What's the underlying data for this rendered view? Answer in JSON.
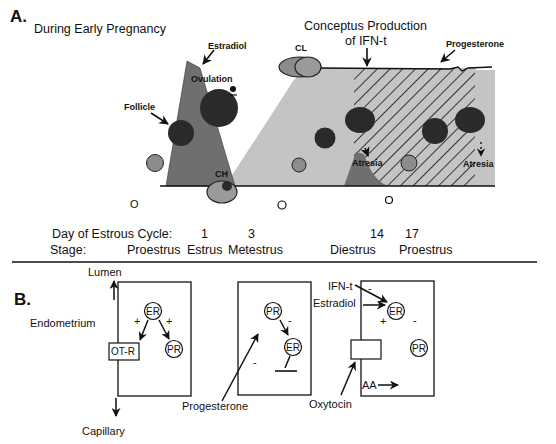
{
  "panel_a": {
    "label": "A.",
    "title": "During Early Pregnancy",
    "annotations": {
      "estradiol": "Estradiol",
      "ovulation": "Ovulation",
      "follicle": "Follicle",
      "ch": "CH",
      "cl": "CL",
      "conceptus_line1": "Conceptus Production",
      "conceptus_line2": "of IFN-t",
      "progesterone": "Progesterone",
      "atresia_1": "Atresia",
      "atresia_2": "Atresia"
    },
    "axis": {
      "day_label": "Day of Estrous Cycle:",
      "days": [
        "1",
        "3",
        "14",
        "17"
      ],
      "stage_label": "Stage:",
      "stages": [
        "Proestrus",
        "Estrus",
        "Metestrus",
        "Diestrus",
        "Proestrus"
      ]
    }
  },
  "panel_b": {
    "label": "B.",
    "cell1": {
      "lumen": "Lumen",
      "endometrium": "Endometrium",
      "capillary": "Capillary",
      "er": "ER",
      "pr": "PR",
      "otr": "OT-R",
      "plus_left": "+",
      "plus_right": "+"
    },
    "cell2": {
      "pr": "PR",
      "er": "ER",
      "minus_pr_er": "-",
      "minus_left": "-",
      "progesterone": "Progesterone"
    },
    "cell3": {
      "ifnt": "IFN-t",
      "estradiol": "Estradiol",
      "er": "ER",
      "pr": "PR",
      "plus": "+",
      "minus_top": "-",
      "minus_right": "-",
      "oxytocin": "Oxytocin",
      "aa": "AA"
    }
  },
  "colors": {
    "dark_gray": "#6f6f6f",
    "light_gray": "#c4c4c4",
    "mid_gray": "#8c8c8c",
    "black_follicle": "#2a2a2a",
    "line": "#111111"
  }
}
